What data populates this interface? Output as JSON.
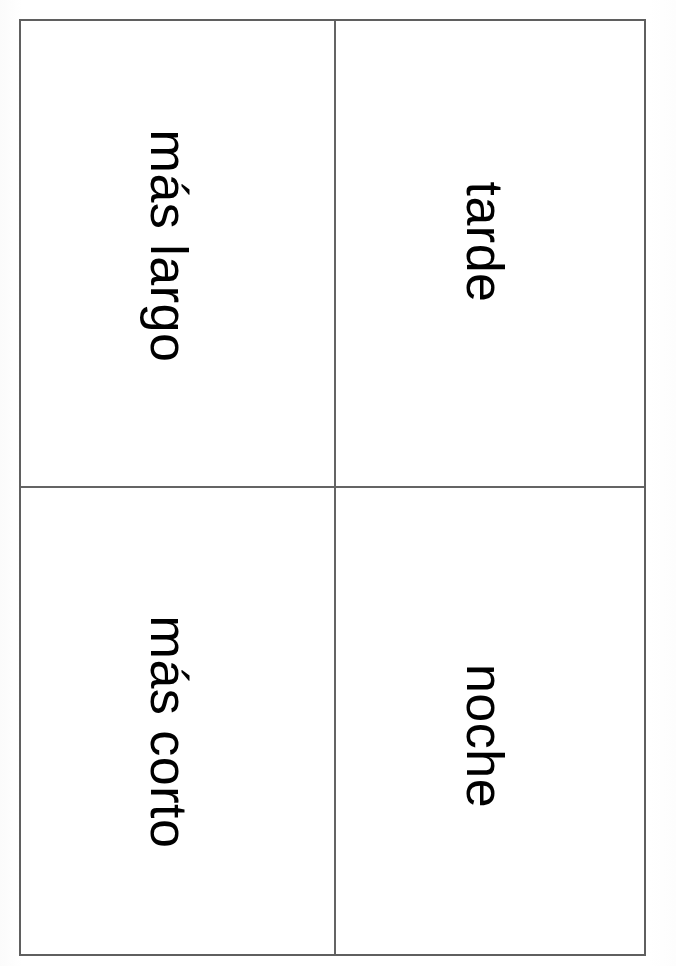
{
  "page": {
    "document_type": "vocabulary-flashcard-sheet",
    "language": "Spanish",
    "orientation": "rotated-90",
    "background_color": "#ffffff",
    "border_color": "#5f5f5f",
    "divider_color": "#646464",
    "text_color": "#000000"
  },
  "grid": {
    "rows": 2,
    "columns": 2,
    "cells": [
      {
        "id": "top-left",
        "term": "más largo",
        "row": 1,
        "column": 1
      },
      {
        "id": "top-right",
        "term": "tarde",
        "row": 1,
        "column": 2
      },
      {
        "id": "bottom-left",
        "term": "más corto",
        "row": 2,
        "column": 1
      },
      {
        "id": "bottom-right",
        "term": "noche",
        "row": 2,
        "column": 2
      }
    ]
  }
}
